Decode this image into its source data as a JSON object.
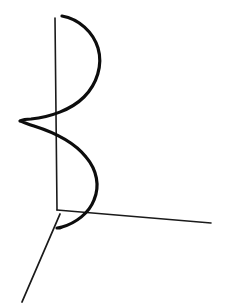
{
  "figure": {
    "kind": "hand-drawn-sketch",
    "title": "3D axes with helix curve",
    "background_color": "#ffffff",
    "ink_color": "#0d0d0d",
    "axis_color": "#1a1a1a",
    "canvas": {
      "width": 228,
      "height": 306
    },
    "origin": {
      "x": 57,
      "y": 210
    },
    "axes": [
      {
        "name": "vertical-axis",
        "label": "",
        "stroke_width": 1.6,
        "from": {
          "x": 55,
          "y": 18
        },
        "to": {
          "x": 57,
          "y": 210
        }
      },
      {
        "name": "right-axis",
        "label": "",
        "stroke_width": 1.6,
        "from": {
          "x": 57,
          "y": 210
        },
        "to": {
          "x": 211,
          "y": 223
        }
      },
      {
        "name": "front-left-axis",
        "label": "",
        "stroke_width": 1.8,
        "from": {
          "x": 60,
          "y": 214
        },
        "to": {
          "x": 22,
          "y": 302
        }
      }
    ],
    "curve": {
      "name": "helix",
      "turns": 2,
      "stroke_width": 3.2,
      "extents": {
        "left_x": 20,
        "right_x": 101,
        "top_y": 16,
        "bottom_y": 228
      },
      "path": "M 62 16 C 79 19 93 32 98 48 C 103 65 97 84 84 97 C 71 110 50 117 31 119 C 26 119 22 120 20 121 C 23 122 28 124 34 126 C 53 132 74 142 86 157 C 97 170 100 186 94 200 C 89 213 76 223 62 227 C 60 228 58 228 57 228"
    },
    "notes": ""
  }
}
